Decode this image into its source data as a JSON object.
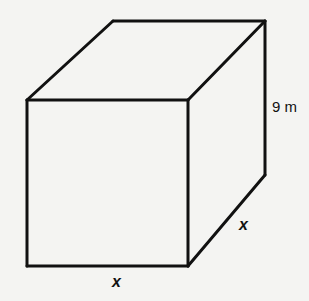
{
  "figure": {
    "shape": "rectangular prism (square base)",
    "labels": {
      "height": "9 m",
      "depth": "x",
      "width": "x"
    }
  }
}
